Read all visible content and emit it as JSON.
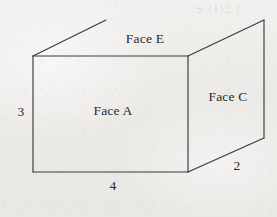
{
  "figure": {
    "background_color": "#eeedeb",
    "line_color": "#3a3a3a",
    "text_color": "#2b2b2b",
    "labels": {
      "face_a": "Face A",
      "face_c": "Face C",
      "face_e": "Face E",
      "dim_height": "3",
      "dim_width": "4",
      "dim_depth": "2"
    },
    "bleed_through_text": "S (I)2 (",
    "geometry": {
      "front_face_top_left": [
        33,
        56
      ],
      "front_face_top_right": [
        188,
        56
      ],
      "front_face_bottom_right": [
        188,
        172
      ],
      "front_face_bottom_left": [
        33,
        172
      ],
      "back_top_left": [
        106,
        20
      ],
      "back_top_right": [
        264,
        20
      ],
      "back_bottom_right": [
        264,
        138
      ]
    }
  }
}
